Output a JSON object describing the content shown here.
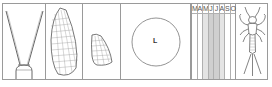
{
  "plate": {
    "panels": [
      {
        "id": "head-antennae",
        "description": "insect head with long antennae"
      },
      {
        "id": "forewing",
        "description": "forewing venation"
      },
      {
        "id": "hindwing",
        "description": "hindwing venation"
      },
      {
        "id": "size-circle",
        "description": "size circle",
        "label": "L"
      },
      {
        "id": "flight-period",
        "description": "flight period chart"
      },
      {
        "id": "nymph",
        "description": "nymph/larva illustration"
      }
    ],
    "size_circle_label": "L",
    "months": [
      {
        "label": "M",
        "shade": "none"
      },
      {
        "label": "A",
        "shade": "none"
      },
      {
        "label": "M",
        "shade": "light"
      },
      {
        "label": "J",
        "shade": "dark"
      },
      {
        "label": "J",
        "shade": "dark"
      },
      {
        "label": "A",
        "shade": "light"
      },
      {
        "label": "S",
        "shade": "none"
      },
      {
        "label": "O",
        "shade": "none"
      }
    ],
    "colors": {
      "line": "#9a9a9a",
      "drawing": "#555555",
      "shade_light": "#e4e4e4",
      "shade_dark": "#cfcfcf"
    }
  }
}
